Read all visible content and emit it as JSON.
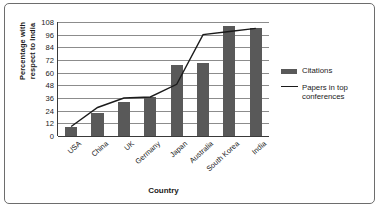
{
  "chart_data": {
    "type": "bar",
    "title": "",
    "xlabel": "Country",
    "ylabel": "Percentage with respect to India",
    "ylabel_line1": "Percentage with",
    "ylabel_line2": "respect to India",
    "categories": [
      "USA",
      "China",
      "UK",
      "Germany",
      "Japan",
      "Australia",
      "South Korea",
      "India"
    ],
    "ylim": [
      0,
      108
    ],
    "yticks": [
      0,
      12,
      24,
      36,
      48,
      60,
      72,
      84,
      96,
      108
    ],
    "grid": true,
    "legend_position": "right",
    "series": [
      {
        "name": "Citations",
        "type": "bar",
        "color": "#595959",
        "values": [
          9,
          22,
          32,
          37,
          67,
          69,
          104,
          102
        ]
      },
      {
        "name": "Papers in top conferences",
        "type": "line",
        "color": "#1b1b1b",
        "values": [
          9,
          27,
          36,
          37,
          49,
          96,
          99,
          102
        ]
      }
    ]
  },
  "legend": {
    "items": [
      {
        "label": "Citations",
        "marker": "bar-swatch"
      },
      {
        "label": "Papers in top\nconferences",
        "marker": "line-swatch"
      }
    ]
  },
  "colors": {
    "bar": "#595959",
    "line": "#1b1b1b",
    "grid": "#8c8c8c",
    "axis": "#3a3a3a",
    "frame": "#6d6d6d",
    "background": "#ffffff",
    "text": "#1b1b1b"
  }
}
